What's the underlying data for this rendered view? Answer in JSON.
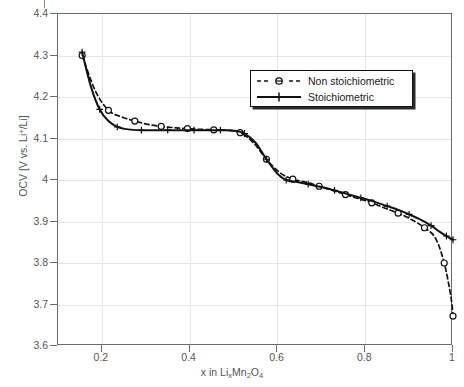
{
  "chart_data": {
    "type": "line",
    "title": "",
    "xlabel": "x in LixMn2O4",
    "ylabel": "OCV [V vs. Li+/Li]",
    "xlim": [
      0.1,
      1.0
    ],
    "ylim": [
      3.6,
      4.4
    ],
    "grid": true,
    "legend_position": "upper-right-inside",
    "xticks": [
      "0.2",
      "0.4",
      "0.6",
      "0.8",
      "1"
    ],
    "xtick_values": [
      0.2,
      0.4,
      0.6,
      0.8,
      1.0
    ],
    "yticks": [
      "4.4",
      "4.3",
      "4.2",
      "4.1",
      "4",
      "3.9",
      "3.8",
      "3.7",
      "3.6"
    ],
    "ytick_values": [
      4.4,
      4.3,
      4.2,
      4.1,
      4.0,
      3.9,
      3.8,
      3.7,
      3.6
    ],
    "series": [
      {
        "name": "Non stoichiometric",
        "style": "dashed",
        "marker": "circle",
        "color": "#111111",
        "x": [
          0.155,
          0.185,
          0.215,
          0.245,
          0.275,
          0.305,
          0.335,
          0.365,
          0.395,
          0.425,
          0.455,
          0.485,
          0.515,
          0.545,
          0.575,
          0.605,
          0.635,
          0.665,
          0.695,
          0.725,
          0.755,
          0.785,
          0.815,
          0.845,
          0.875,
          0.905,
          0.935,
          0.96,
          0.98,
          0.995,
          1.0
        ],
        "y": [
          4.3,
          4.215,
          4.168,
          4.152,
          4.142,
          4.134,
          4.129,
          4.126,
          4.124,
          4.122,
          4.121,
          4.12,
          4.114,
          4.09,
          4.05,
          4.018,
          4.002,
          3.995,
          3.985,
          3.975,
          3.965,
          3.955,
          3.945,
          3.932,
          3.92,
          3.905,
          3.885,
          3.86,
          3.8,
          3.72,
          3.672
        ]
      },
      {
        "name": "Stoichiometric",
        "style": "solid",
        "marker": "plus",
        "color": "#111111",
        "x": [
          0.155,
          0.175,
          0.195,
          0.215,
          0.235,
          0.26,
          0.29,
          0.32,
          0.35,
          0.38,
          0.41,
          0.44,
          0.47,
          0.5,
          0.525,
          0.55,
          0.575,
          0.6,
          0.62,
          0.645,
          0.67,
          0.7,
          0.73,
          0.76,
          0.79,
          0.82,
          0.85,
          0.875,
          0.9,
          0.925,
          0.95,
          0.97,
          0.985,
          1.0
        ],
        "y": [
          4.308,
          4.225,
          4.17,
          4.142,
          4.128,
          4.122,
          4.12,
          4.12,
          4.12,
          4.12,
          4.12,
          4.12,
          4.12,
          4.119,
          4.112,
          4.09,
          4.05,
          4.015,
          4.0,
          3.995,
          3.99,
          3.983,
          3.975,
          3.966,
          3.957,
          3.948,
          3.937,
          3.928,
          3.917,
          3.905,
          3.89,
          3.875,
          3.865,
          3.856
        ]
      }
    ]
  },
  "legend": {
    "items": [
      {
        "label": "Non stoichiometric"
      },
      {
        "label": "Stoichiometric"
      }
    ]
  },
  "axes": {
    "y_title_prefix": "OCV [V vs. Li",
    "y_title_sup": "+",
    "y_title_suffix": "/Li]",
    "x_title_a": "x in Li",
    "x_title_sub1": "x",
    "x_title_b": "Mn",
    "x_title_sub2": "2",
    "x_title_c": "O",
    "x_title_sub3": "4"
  },
  "colors": {
    "series": "#111111",
    "axis": "#6b6b6b",
    "grid": "#e6e6e6",
    "tick_text": "#555555",
    "background": "#ffffff"
  }
}
